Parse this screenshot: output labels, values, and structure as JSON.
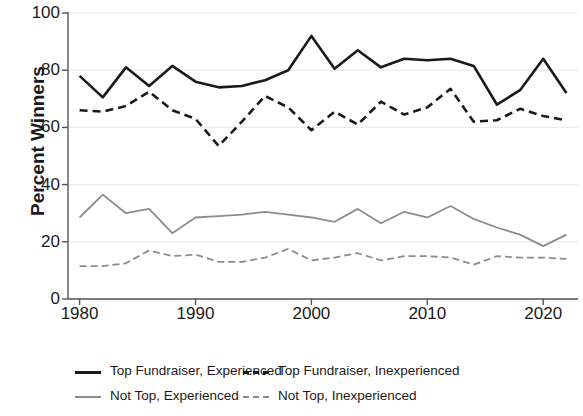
{
  "chart_data": {
    "type": "line",
    "title": "",
    "xlabel": "",
    "ylabel": "Percent Winners",
    "xlim": [
      1979,
      2023
    ],
    "ylim": [
      0,
      100
    ],
    "grid": true,
    "grid_axis": "y",
    "legend_position": "bottom",
    "x": [
      1980,
      1982,
      1984,
      1986,
      1988,
      1990,
      1992,
      1994,
      1996,
      1998,
      2000,
      2002,
      2004,
      2006,
      2008,
      2010,
      2012,
      2014,
      2016,
      2018,
      2020,
      2022
    ],
    "xticks": [
      1980,
      1990,
      2000,
      2010,
      2020
    ],
    "xtick_labels": [
      "1980",
      "1990",
      "2000",
      "2010",
      "2020"
    ],
    "yticks": [
      0,
      20,
      40,
      60,
      80,
      100
    ],
    "ytick_labels": [
      "0",
      "20",
      "40",
      "60",
      "80",
      "100"
    ],
    "series": [
      {
        "name": "Top Fundraiser, Experienced",
        "style": "solid",
        "color": "#1a1a1a",
        "width": 2.6,
        "values": [
          78,
          70.5,
          81,
          74.5,
          81.5,
          76,
          74,
          74.5,
          76.5,
          80,
          92,
          80.5,
          87,
          81,
          84,
          83.5,
          84,
          81.5,
          68,
          73,
          84,
          72
        ]
      },
      {
        "name": "Top Fundraiser, Inexperienced",
        "style": "dashed",
        "color": "#1a1a1a",
        "width": 2.6,
        "values": [
          66,
          65.5,
          67.5,
          72.5,
          66,
          63,
          53.5,
          62,
          71,
          67,
          59,
          65.5,
          61,
          69,
          64.5,
          67,
          73.5,
          62,
          62.5,
          66.5,
          64,
          62.5
        ]
      },
      {
        "name": "Not Top, Experienced",
        "style": "solid",
        "color": "#8c8c8c",
        "width": 1.8,
        "values": [
          28.5,
          36.5,
          30,
          31.5,
          23,
          28.5,
          29,
          29.5,
          30.5,
          29.5,
          28.5,
          27,
          31.5,
          26.5,
          30.5,
          28.5,
          32.5,
          28,
          25,
          22.5,
          18.5,
          22.5
        ]
      },
      {
        "name": "Not Top, Inexperienced",
        "style": "dashed",
        "color": "#8c8c8c",
        "width": 1.8,
        "values": [
          11.5,
          11.5,
          12.5,
          17,
          15,
          15.5,
          13,
          13,
          14.5,
          17.5,
          13.5,
          14.5,
          16,
          13.5,
          15,
          15,
          14.5,
          12,
          15,
          14.5,
          14.5,
          14
        ]
      }
    ]
  },
  "axes": {
    "y_title": "Percent Winners"
  },
  "legend": {
    "items": [
      {
        "label": "Top Fundraiser, Experienced",
        "style": "solid",
        "color": "#1a1a1a"
      },
      {
        "label": "Top Fundraiser, Inexperienced",
        "style": "dashed",
        "color": "#1a1a1a"
      },
      {
        "label": "Not Top, Experienced",
        "style": "solid",
        "color": "#8c8c8c"
      },
      {
        "label": "Not Top, Inexperienced",
        "style": "dashed",
        "color": "#8c8c8c"
      }
    ]
  }
}
